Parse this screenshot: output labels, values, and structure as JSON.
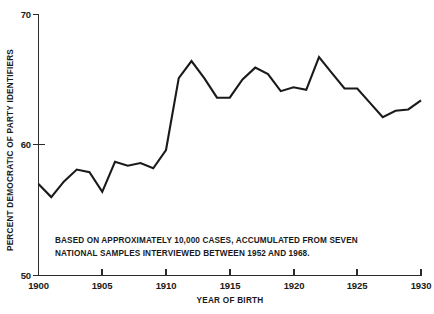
{
  "chart_data": {
    "type": "line",
    "title": "",
    "xlabel": "YEAR OF BIRTH",
    "ylabel": "PERCENT DEMOCRATIC OF PARTY IDENTIFIERS",
    "xlim": [
      1900,
      1930
    ],
    "ylim": [
      50,
      70
    ],
    "grid": false,
    "legend": null,
    "xticks": [
      1900,
      1905,
      1910,
      1915,
      1920,
      1925,
      1930
    ],
    "xtick_labels": [
      "1900",
      "1905",
      "1910",
      "1915",
      "1920",
      "1925",
      "1930"
    ],
    "yticks": [
      50,
      60,
      70
    ],
    "ytick_labels": [
      "50",
      "60",
      "70"
    ],
    "x": [
      1900,
      1901,
      1902,
      1903,
      1904,
      1905,
      1906,
      1907,
      1908,
      1909,
      1910,
      1911,
      1912,
      1913,
      1914,
      1915,
      1916,
      1917,
      1918,
      1919,
      1920,
      1921,
      1922,
      1923,
      1924,
      1925,
      1926,
      1927,
      1928,
      1929,
      1930
    ],
    "values": [
      57.0,
      56.0,
      57.2,
      58.1,
      57.9,
      56.4,
      58.7,
      58.4,
      58.6,
      58.2,
      59.6,
      65.1,
      66.4,
      65.1,
      63.6,
      63.6,
      65.0,
      65.9,
      65.4,
      64.1,
      64.4,
      64.2,
      66.7,
      65.5,
      64.3,
      64.3,
      63.2,
      62.1,
      62.6,
      62.7,
      63.4
    ],
    "annotations": [
      "BASED ON APPROXIMATELY 10,000 CASES, ACCUMULATED FROM SEVEN",
      "NATIONAL SAMPLES INTERVIEWED BETWEEN  1952 AND 1968."
    ],
    "line_color": "#1a1a1a",
    "axis_color": "#2b2b2b",
    "background_color": "#ffffff"
  }
}
